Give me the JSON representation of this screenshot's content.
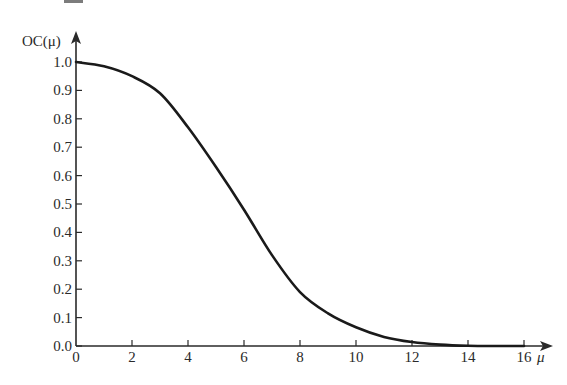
{
  "chart_data": {
    "type": "line",
    "title": "",
    "xlabel": "μ",
    "ylabel": "OC(μ)",
    "xlim": [
      0,
      16
    ],
    "ylim": [
      0.0,
      1.0
    ],
    "grid": false,
    "legend": null,
    "x_ticks": [
      0,
      2,
      4,
      6,
      8,
      10,
      12,
      14,
      16
    ],
    "x_tick_labels": [
      "0",
      "2",
      "4",
      "6",
      "8",
      "10",
      "12",
      "14",
      "16"
    ],
    "y_ticks": [
      0.0,
      0.1,
      0.2,
      0.3,
      0.4,
      0.5,
      0.6,
      0.7,
      0.8,
      0.9,
      1.0
    ],
    "y_tick_labels": [
      "0.0",
      "0.1",
      "0.2",
      "0.3",
      "0.4",
      "0.5",
      "0.6",
      "0.7",
      "0.8",
      "0.9",
      "1.0"
    ],
    "series": [
      {
        "name": "OC(μ)",
        "x": [
          0,
          1,
          2,
          3,
          4,
          5,
          6,
          7,
          8,
          9,
          10,
          11,
          12,
          13,
          14,
          15,
          16
        ],
        "values": [
          1.0,
          0.985,
          0.95,
          0.89,
          0.77,
          0.63,
          0.48,
          0.32,
          0.19,
          0.115,
          0.066,
          0.032,
          0.014,
          0.005,
          0.001,
          0.0,
          0.0
        ]
      }
    ]
  },
  "labels": {
    "y_axis_title": "OC(μ)",
    "x_axis_title": "μ"
  },
  "style": {
    "line_color": "#1a1a1a",
    "axis_color": "#2a2a2a",
    "background": "#ffffff"
  }
}
